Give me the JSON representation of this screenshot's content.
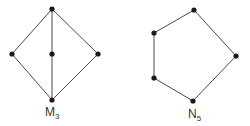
{
  "colors": {
    "edge": "#4a4a4a",
    "node": "#1a1a1a",
    "label": "#333333",
    "background": "#ffffff"
  },
  "diagrams": [
    {
      "id": "m3",
      "label_main": "M",
      "label_sub": "3",
      "nodes": [
        {
          "id": "top",
          "x": 52,
          "y": 9
        },
        {
          "id": "left",
          "x": 12,
          "y": 54
        },
        {
          "id": "middle",
          "x": 52,
          "y": 54
        },
        {
          "id": "right",
          "x": 98,
          "y": 54
        },
        {
          "id": "bottom",
          "x": 52,
          "y": 100
        }
      ],
      "edges": [
        [
          "top",
          "left"
        ],
        [
          "top",
          "middle"
        ],
        [
          "top",
          "right"
        ],
        [
          "left",
          "bottom"
        ],
        [
          "middle",
          "bottom"
        ],
        [
          "right",
          "bottom"
        ]
      ]
    },
    {
      "id": "n5",
      "label_main": "N",
      "label_sub": "5",
      "nodes": [
        {
          "id": "top",
          "x": 194,
          "y": 10
        },
        {
          "id": "upper-left",
          "x": 154,
          "y": 33
        },
        {
          "id": "lower-left",
          "x": 154,
          "y": 78
        },
        {
          "id": "bottom",
          "x": 193,
          "y": 101
        },
        {
          "id": "right",
          "x": 236,
          "y": 56
        }
      ],
      "edges": [
        [
          "top",
          "upper-left"
        ],
        [
          "upper-left",
          "lower-left"
        ],
        [
          "lower-left",
          "bottom"
        ],
        [
          "bottom",
          "right"
        ],
        [
          "right",
          "top"
        ]
      ]
    }
  ]
}
